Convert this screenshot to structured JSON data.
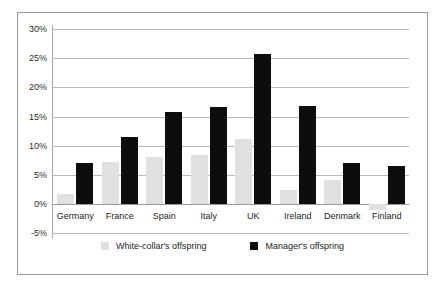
{
  "chart_data": {
    "type": "bar",
    "title": "",
    "subtitle": "",
    "xlabel": "",
    "ylabel": "",
    "categories": [
      "Germany",
      "France",
      "Spain",
      "Italy",
      "UK",
      "Ireland",
      "Denmark",
      "Finland"
    ],
    "series": [
      {
        "name": "White-collar's offspring",
        "color": "#e0e0e0",
        "values": [
          1.8,
          7.2,
          8.1,
          8.4,
          11.2,
          2.4,
          4.2,
          -1.0
        ]
      },
      {
        "name": "Manager's offspring",
        "color": "#0d0d0d",
        "values": [
          7.1,
          11.5,
          15.8,
          16.7,
          25.8,
          16.8,
          7.0,
          6.5
        ]
      }
    ],
    "ylim": [
      -5,
      30
    ],
    "ytick_values": [
      30,
      25,
      20,
      15,
      10,
      5,
      0,
      -5
    ],
    "ytick_labels": [
      "30%",
      "25%",
      "20%",
      "15%",
      "10%",
      "5%",
      "0%",
      "-5%"
    ],
    "grid": true,
    "legend_position": "bottom",
    "value_suffix": "%"
  },
  "legend": {
    "items": [
      {
        "label": "White-collar's offspring",
        "swatch": "white-collar"
      },
      {
        "label": "Manager's offspring",
        "swatch": "manager"
      }
    ]
  }
}
